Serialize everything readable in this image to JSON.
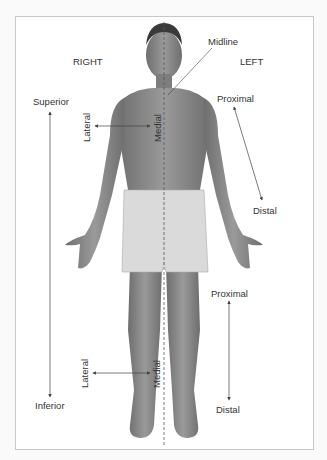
{
  "diagram": {
    "type": "anatomical-directional-terms",
    "colors": {
      "background": "#ffffff",
      "frame_border": "#c8c8c8",
      "text": "#333333",
      "skin": "#8a8a8a",
      "shorts": "#d9d9d9",
      "arrow": "#444444",
      "midline": "#555555"
    },
    "labels": {
      "right": "RIGHT",
      "left": "LEFT",
      "midline": "Midline",
      "superior": "Superior",
      "inferior": "Inferior",
      "upper_proximal": "Proximal",
      "upper_distal": "Distal",
      "lower_proximal": "Proximal",
      "lower_distal": "Distal",
      "upper_lateral": "Lateral",
      "upper_medial": "Medial",
      "lower_lateral": "Lateral",
      "lower_medial": "Medial"
    },
    "arrows": [
      {
        "name": "superior-inferior",
        "from": "Superior",
        "to": "Inferior",
        "direction": "bidirectional vertical"
      },
      {
        "name": "upper-lateral-medial",
        "from": "Lateral",
        "to": "Medial",
        "region": "chest"
      },
      {
        "name": "arm-proximal-distal",
        "from": "Proximal",
        "to": "Distal",
        "region": "left arm"
      },
      {
        "name": "leg-proximal-distal",
        "from": "Proximal",
        "to": "Distal",
        "region": "left leg"
      },
      {
        "name": "lower-lateral-medial",
        "from": "Lateral",
        "to": "Medial",
        "region": "right shin"
      }
    ]
  }
}
